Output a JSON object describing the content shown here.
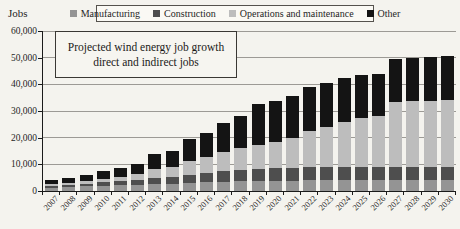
{
  "page": {
    "y_axis_title": "Jobs"
  },
  "annotation": {
    "line1": "Projected wind energy job growth",
    "line2": "direct and indirect jobs"
  },
  "chart_data": {
    "type": "bar",
    "stacked": true,
    "title": "Projected wind energy job growth direct and indirect jobs",
    "ylabel": "Jobs",
    "xlabel": "",
    "ylim": [
      0,
      60000
    ],
    "ytick_step": 10000,
    "yticks": [
      {
        "value": 0,
        "label": "0"
      },
      {
        "value": 10000,
        "label": "10,000"
      },
      {
        "value": 20000,
        "label": "20,000"
      },
      {
        "value": 30000,
        "label": "30,000"
      },
      {
        "value": 40000,
        "label": "40,000"
      },
      {
        "value": 50000,
        "label": "50,000"
      },
      {
        "value": 60000,
        "label": "60,000"
      }
    ],
    "grid": true,
    "legend_position": "top",
    "categories": [
      "2007",
      "2008",
      "2009",
      "2010",
      "2011",
      "2012",
      "2013",
      "2014",
      "2015",
      "2016",
      "2017",
      "2018",
      "2019",
      "2020",
      "2021",
      "2022",
      "2023",
      "2024",
      "2025",
      "2026",
      "2027",
      "2028",
      "2029",
      "2030"
    ],
    "series": [
      {
        "name": "Manufacturing",
        "color": "#949494",
        "values": [
          1300,
          1400,
          1700,
          2000,
          2200,
          2400,
          2700,
          2800,
          3100,
          3300,
          3500,
          3600,
          3700,
          3800,
          3900,
          4100,
          4100,
          4100,
          4100,
          4100,
          4100,
          4100,
          4100,
          4100
        ]
      },
      {
        "name": "Construction",
        "color": "#4e4e4e",
        "values": [
          700,
          800,
          1000,
          1200,
          1400,
          1700,
          2200,
          2400,
          3000,
          3400,
          3900,
          4200,
          4500,
          4700,
          4800,
          4900,
          4900,
          4900,
          4900,
          4900,
          4900,
          4900,
          4900,
          4900
        ]
      },
      {
        "name": "Operations and maintenance",
        "color": "#bdbdbd",
        "values": [
          500,
          700,
          1000,
          1400,
          1800,
          2300,
          3200,
          3900,
          5200,
          6200,
          7300,
          8400,
          8900,
          10000,
          11300,
          13500,
          15000,
          17000,
          18200,
          19000,
          24400,
          24700,
          24800,
          25300
        ]
      },
      {
        "name": "Other",
        "color": "#141414",
        "values": [
          1500,
          1800,
          2400,
          3000,
          3400,
          3900,
          5800,
          5900,
          8200,
          8900,
          10800,
          11800,
          15400,
          15300,
          15500,
          16500,
          16500,
          16500,
          16300,
          16000,
          16100,
          16100,
          16500,
          16500
        ]
      }
    ]
  }
}
